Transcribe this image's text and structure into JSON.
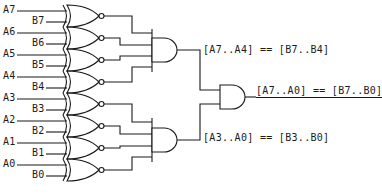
{
  "diagram": {
    "type": "logic-circuit",
    "inputs": [
      {
        "a": "A7",
        "b": "B7"
      },
      {
        "a": "A6",
        "b": "B6"
      },
      {
        "a": "A5",
        "b": "B5"
      },
      {
        "a": "A4",
        "b": "B4"
      },
      {
        "a": "A3",
        "b": "B3"
      },
      {
        "a": "A2",
        "b": "B2"
      },
      {
        "a": "A1",
        "b": "B1"
      },
      {
        "a": "A0",
        "b": "B0"
      }
    ],
    "gates": {
      "xnor_count": 8,
      "and_upper": "4-input AND",
      "and_lower": "4-input AND",
      "and_final": "2-input AND"
    },
    "labels": {
      "upper": "[A7..A4] == [B7..B4]",
      "lower": "[A3..A0] == [B3..B0]",
      "final": "[A7..A0] == [B7..B0]"
    },
    "colors": {
      "line": "#1a1a1a",
      "background": "#ffffff"
    }
  }
}
